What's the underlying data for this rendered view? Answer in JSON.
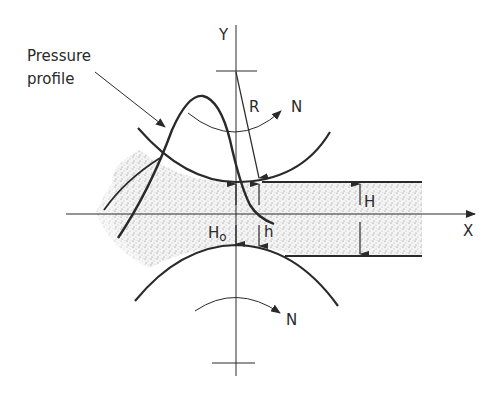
{
  "diagram": {
    "type": "elastohydrodynamic-rolling-contact",
    "labels": {
      "pressure_profile_line1": "Pressure",
      "pressure_profile_line2": "profile",
      "y_axis": "Y",
      "x_axis": "X",
      "radius": "R",
      "rotation_top": "N",
      "rotation_bottom": "N",
      "central_film": "H",
      "min_film_H": "H",
      "min_film_sub": "o",
      "local_film": "h"
    },
    "colors": {
      "ink": "#2a2a2a",
      "stipple": "#7a7a7a",
      "background": "#ffffff"
    }
  }
}
